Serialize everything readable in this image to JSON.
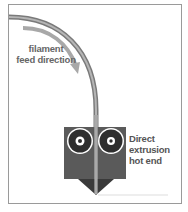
{
  "diagram": {
    "labels": {
      "feed_line1": "filament",
      "feed_line2": "feed direction",
      "hotend_line1": "Direct",
      "hotend_line2": "extrusion",
      "hotend_line3": "hot end"
    },
    "colors": {
      "frame": "#9a9a9a",
      "filament_tube": "#7a7a7a",
      "filament_core": "#b0b0b0",
      "arrow": "#a8a8a8",
      "hotend_body": "#5a5a5a",
      "gear": "#2e2e2e",
      "nozzle": "#3a3a3a"
    }
  }
}
